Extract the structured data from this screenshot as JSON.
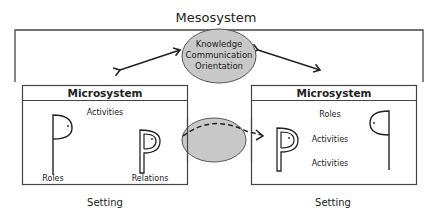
{
  "diagram": {
    "title": "Mesosystem",
    "center_ellipse": {
      "lines": [
        "Knowledge",
        "Communication",
        "Orientation"
      ],
      "fill": "#c8c8c8"
    },
    "transfer_ellipse": {
      "fill": "#c8c8c8"
    },
    "left_box": {
      "header": "Microsystem",
      "labels": {
        "activities": "Activities",
        "roles": "Roles",
        "relations": "Relations"
      },
      "caption": "Setting"
    },
    "right_box": {
      "header": "Microsystem",
      "labels": {
        "roles": "Roles",
        "activities_1": "Activities",
        "activities_2": "Activities"
      },
      "caption": "Setting"
    },
    "colors": {
      "stroke": "#333333",
      "ellipse_fill": "#c8c8c8",
      "ellipse_stroke": "#555555"
    }
  }
}
